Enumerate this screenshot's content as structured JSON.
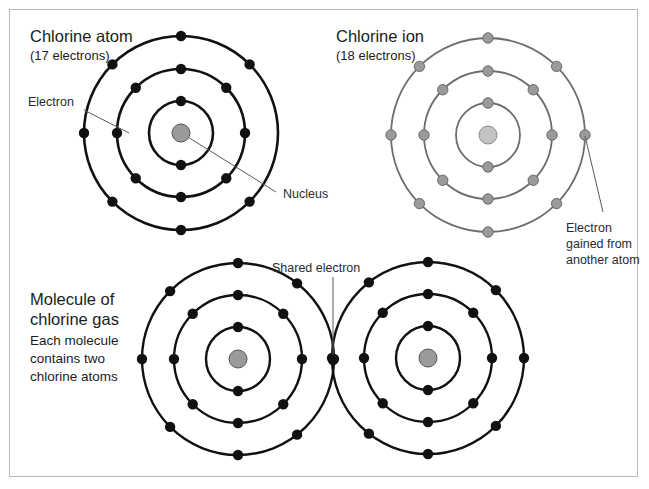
{
  "figure": {
    "background_color": "#ffffff",
    "frame_color": "#b9b9b9"
  },
  "colors": {
    "atom_stroke": "#111111",
    "atom_electron": "#111111",
    "atom_nucleus_fill": "#9a9a9a",
    "atom_nucleus_stroke": "#555555",
    "ion_stroke": "#6e6e6e",
    "ion_electron_fill": "#9a9a9a",
    "ion_electron_stroke": "#6a6a6a",
    "ion_nucleus_fill": "#c2c2c2",
    "ion_nucleus_stroke": "#8a8a8a",
    "leader_line": "#5a5a5a",
    "text": "#1c1c1c"
  },
  "panels": {
    "atom": {
      "title": "Chlorine atom",
      "subtitle": "(17 electrons)",
      "center": {
        "x": 181,
        "y": 133
      },
      "shell_radii": [
        32,
        64,
        97
      ],
      "nucleus_radius": 9,
      "shell_electron_counts": [
        2,
        8,
        7
      ],
      "shell_electron_angles": [
        [
          -90,
          90
        ],
        [
          -90,
          -45,
          0,
          45,
          90,
          135,
          180,
          225
        ],
        [
          -90,
          -45,
          45,
          90,
          135,
          180,
          225
        ]
      ],
      "electron_radius": 5.2,
      "labels": {
        "electron": "Electron",
        "nucleus": "Nucleus"
      }
    },
    "ion": {
      "title": "Chlorine ion",
      "subtitle": "(18 electrons)",
      "center": {
        "x": 488,
        "y": 135
      },
      "shell_radii": [
        32,
        64,
        97
      ],
      "nucleus_radius": 9,
      "shell_electron_counts": [
        2,
        8,
        8
      ],
      "shell_electron_angles": [
        [
          -90,
          90
        ],
        [
          -90,
          -45,
          0,
          45,
          90,
          135,
          180,
          225
        ],
        [
          -90,
          -45,
          0,
          45,
          90,
          135,
          180,
          225
        ]
      ],
      "electron_radius": 5.2,
      "labels": {
        "gained_line_1": "Electron",
        "gained_line_2": "gained from",
        "gained_line_3": "another atom"
      }
    },
    "molecule": {
      "title_line_1": "Molecule of",
      "title_line_2": "chlorine gas",
      "body_line_1": "Each molecule",
      "body_line_2": "contains two",
      "body_line_3": "chlorine atoms",
      "shared_label": "Shared electron",
      "left_atom_center": {
        "x": 238,
        "y": 359
      },
      "right_atom_center": {
        "x": 428,
        "y": 358
      },
      "shell_radii": [
        32,
        64,
        96
      ],
      "nucleus_radius": 9,
      "shell_electron_counts": [
        2,
        8,
        7
      ],
      "electron_radius": 5.2,
      "left_shell_electron_angles": [
        [
          -90,
          90
        ],
        [
          -90,
          -45,
          0,
          45,
          90,
          135,
          180,
          225
        ],
        [
          -90,
          -52,
          0,
          52,
          90,
          135,
          180,
          225
        ]
      ],
      "right_shell_electron_angles": [
        [
          -90,
          90
        ],
        [
          -90,
          -45,
          0,
          45,
          90,
          135,
          180,
          225
        ],
        [
          -90,
          -45,
          0,
          45,
          90,
          128,
          180,
          232
        ]
      ],
      "shared_electron": {
        "x": 333,
        "y": 360
      }
    }
  },
  "legend_notes": {
    "atom_electron_count": 17,
    "ion_electron_count": 18,
    "molecule_atom_count": 2
  }
}
